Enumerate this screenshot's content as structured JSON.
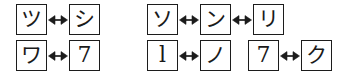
{
  "figure": {
    "arrow_symbol": "↔",
    "arrow_name": "left-right-arrow-icon",
    "ink_color": "#1c1c1c",
    "background_color": "#ffffff",
    "groups": [
      {
        "id": "left",
        "rows": [
          {
            "id": "left-row-1",
            "clusters": [
              {
                "id": "left-row-1-cluster-1",
                "items": [
                  "ツ",
                  "シ"
                ],
                "item_names": [
                  "glyph-tsu",
                  "glyph-shi"
                ],
                "item_scripts": [
                  "katakana",
                  "katakana"
                ]
              }
            ]
          },
          {
            "id": "left-row-2",
            "clusters": [
              {
                "id": "left-row-2-cluster-1",
                "items": [
                  "ワ",
                  "7"
                ],
                "item_names": [
                  "glyph-wa",
                  "glyph-digit-seven"
                ],
                "item_scripts": [
                  "katakana",
                  "latin"
                ]
              }
            ]
          }
        ]
      },
      {
        "id": "right",
        "rows": [
          {
            "id": "right-row-1",
            "clusters": [
              {
                "id": "right-row-1-cluster-1",
                "items": [
                  "ソ",
                  "ン",
                  "リ"
                ],
                "item_names": [
                  "glyph-so",
                  "glyph-n",
                  "glyph-ri"
                ],
                "item_scripts": [
                  "katakana",
                  "katakana",
                  "katakana"
                ]
              }
            ]
          },
          {
            "id": "right-row-2",
            "clusters": [
              {
                "id": "right-row-2-cluster-1",
                "items": [
                  "l",
                  "ノ"
                ],
                "item_names": [
                  "glyph-letter-l",
                  "glyph-no"
                ],
                "item_scripts": [
                  "latin",
                  "katakana"
                ]
              },
              {
                "id": "right-row-2-cluster-2",
                "items": [
                  "7",
                  "ク"
                ],
                "item_names": [
                  "glyph-digit-seven",
                  "glyph-ku"
                ],
                "item_scripts": [
                  "latin",
                  "katakana"
                ]
              }
            ]
          }
        ]
      }
    ]
  }
}
